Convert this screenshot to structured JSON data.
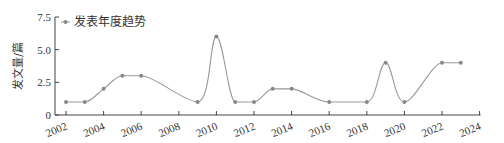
{
  "chart_data": {
    "type": "line",
    "title": "",
    "xlabel": "",
    "ylabel": "发文量/篇",
    "ylim": [
      0,
      7.5
    ],
    "xlim": [
      2002,
      2024
    ],
    "yticks": [
      "0",
      "2.5",
      "5.0",
      "7.5"
    ],
    "xticks": [
      "2002",
      "2004",
      "2006",
      "2008",
      "2010",
      "2012",
      "2014",
      "2016",
      "2018",
      "2020",
      "2022",
      "2024"
    ],
    "grid": false,
    "legend_position": "top-left",
    "smooth": true,
    "series": [
      {
        "name": "发表年度趋势",
        "color": "#999999",
        "x": [
          2002,
          2003,
          2004,
          2005,
          2006,
          2009,
          2010,
          2011,
          2012,
          2013,
          2014,
          2016,
          2018,
          2019,
          2020,
          2022,
          2023
        ],
        "values": [
          1,
          1,
          2,
          3,
          3,
          1,
          6,
          1,
          1,
          2,
          2,
          1,
          1,
          4,
          1,
          4,
          4
        ]
      }
    ]
  },
  "legend": {
    "label": "发表年度趋势"
  },
  "axis": {
    "ylabel": "发文量/篇"
  }
}
